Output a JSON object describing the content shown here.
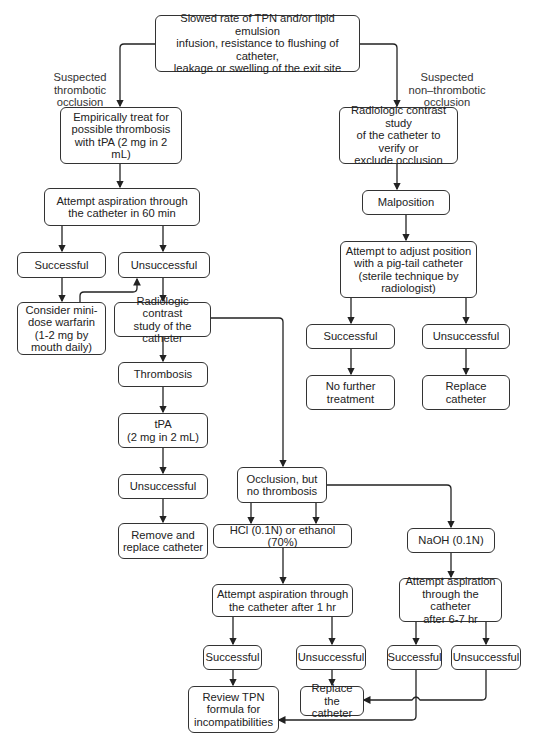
{
  "diagram": {
    "type": "flowchart",
    "nodes": {
      "start": "Slowed rate of TPN and/or lipid emulsion\ninfusion, resistance to flushing of catheter,\nleakage or swelling of the exit site",
      "empiric_tpa": "Empirically treat for\npossible thrombosis\nwith tPA (2 mg in 2 mL)",
      "radiologic_verify": "Radiologic contrast study\nof the catheter to verify or\nexclude occlusion",
      "aspirate_60": "Attempt aspiration through\nthe catheter in 60 min",
      "successful_1": "Successful",
      "unsuccessful_1": "Unsuccessful",
      "warfarin": "Consider mini-\ndose warfarin\n(1-2 mg by\nmouth daily)",
      "radiologic_study": "Radiologic contrast\nstudy of the catheter",
      "malposition": "Malposition",
      "pigtail": "Attempt to adjust position\nwith a pig-tail catheter\n(sterile technique by\nradiologist)",
      "successful_2": "Successful",
      "unsuccessful_2": "Unsuccessful",
      "no_further": "No further\ntreatment",
      "replace_2": "Replace\ncatheter",
      "thrombosis": "Thrombosis",
      "tpa": "tPA\n(2 mg in 2 mL)",
      "unsuccessful_3": "Unsuccessful",
      "remove_replace": "Remove and\nreplace catheter",
      "occlusion": "Occlusion, but\nno thrombosis",
      "hcl": "HCl (0.1N) or ethanol (70%)",
      "naoh": "NaOH (0.1N)",
      "aspirate_1hr": "Attempt aspiration through\nthe catheter after 1 hr",
      "aspirate_67hr": "Attempt aspiration\nthrough the catheter\nafter 6-7 hr",
      "successful_4": "Successful",
      "unsuccessful_4": "Unsuccessful",
      "successful_5": "Successful",
      "unsuccessful_5": "Unsuccessful",
      "review_tpn": "Review TPN\nformula for\nincompatibilities",
      "replace_4": "Replace\nthe catheter"
    },
    "edge_labels": {
      "thrombotic": "Suspected\nthrombotic\nocclusion",
      "non_thrombotic": "Suspected\nnon–thrombotic\nocclusion"
    },
    "colors": {
      "stroke": "#333333",
      "background": "#ffffff",
      "text": "#222222"
    }
  }
}
